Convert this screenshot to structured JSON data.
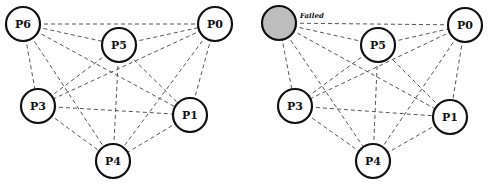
{
  "diagram": {
    "type": "fully-connected process network, before and after failure",
    "panels": [
      {
        "id": "left",
        "nodes": [
          {
            "id": "P6",
            "label": "P6",
            "x": 23,
            "y": 24,
            "failed": false
          },
          {
            "id": "P5",
            "label": "P5",
            "x": 119,
            "y": 45,
            "failed": false
          },
          {
            "id": "P0",
            "label": "P0",
            "x": 215,
            "y": 24,
            "failed": false
          },
          {
            "id": "P3",
            "label": "P3",
            "x": 38,
            "y": 106,
            "failed": false
          },
          {
            "id": "P1",
            "label": "P1",
            "x": 190,
            "y": 115,
            "failed": false
          },
          {
            "id": "P4",
            "label": "P4",
            "x": 113,
            "y": 161,
            "failed": false
          }
        ]
      },
      {
        "id": "right",
        "nodes": [
          {
            "id": "P6",
            "label": "",
            "x": 279,
            "y": 23,
            "failed": true
          },
          {
            "id": "P5",
            "label": "P5",
            "x": 378,
            "y": 45,
            "failed": false
          },
          {
            "id": "P0",
            "label": "P0",
            "x": 465,
            "y": 25,
            "failed": false
          },
          {
            "id": "P3",
            "label": "P3",
            "x": 295,
            "y": 106,
            "failed": false
          },
          {
            "id": "P1",
            "label": "P1",
            "x": 450,
            "y": 117,
            "failed": false
          },
          {
            "id": "P4",
            "label": "P4",
            "x": 373,
            "y": 161,
            "failed": false
          }
        ],
        "annotation": {
          "text": "Failed",
          "x": 300,
          "y": 18
        }
      }
    ],
    "edges": [
      [
        "P6",
        "P0"
      ],
      [
        "P6",
        "P5"
      ],
      [
        "P6",
        "P1"
      ],
      [
        "P6",
        "P3"
      ],
      [
        "P6",
        "P4"
      ],
      [
        "P5",
        "P0"
      ],
      [
        "P5",
        "P3"
      ],
      [
        "P5",
        "P4"
      ],
      [
        "P5",
        "P1"
      ],
      [
        "P0",
        "P3"
      ],
      [
        "P0",
        "P4"
      ],
      [
        "P0",
        "P1"
      ],
      [
        "P3",
        "P1"
      ],
      [
        "P3",
        "P4"
      ],
      [
        "P1",
        "P4"
      ]
    ],
    "node_radius": 17,
    "colors": {
      "edge": "#555555",
      "node_stroke": "#111111",
      "node_fill": "#ffffff",
      "failed_fill": "#bdbdbd"
    }
  }
}
